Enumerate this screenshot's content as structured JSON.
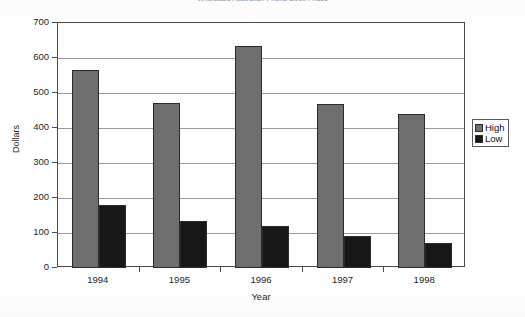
{
  "chart_data": {
    "type": "bar",
    "title": "Wholesale Australian Phone Book Prices",
    "xlabel": "Year",
    "ylabel": "Dollars",
    "categories": [
      "1994",
      "1995",
      "1996",
      "1997",
      "1998"
    ],
    "series": [
      {
        "name": "High",
        "color": "#6e6e6e",
        "values": [
          565,
          472,
          635,
          468,
          440
        ]
      },
      {
        "name": "Low",
        "color": "#171717",
        "values": [
          180,
          135,
          120,
          92,
          72
        ]
      }
    ],
    "ylim": [
      0,
      700
    ],
    "ytick_step": 100,
    "yticks": [
      "0",
      "100",
      "200",
      "300",
      "400",
      "500",
      "600",
      "700"
    ],
    "grid": true,
    "legend_position": "right"
  },
  "legend": {
    "items": [
      {
        "label": "High",
        "swatch": "gray-swatch-icon"
      },
      {
        "label": "Low",
        "swatch": "black-swatch-icon"
      }
    ]
  }
}
